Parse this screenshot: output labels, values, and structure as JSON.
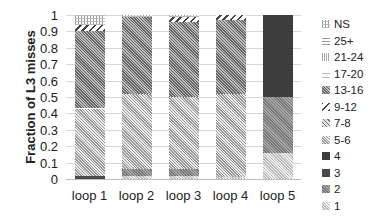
{
  "chart_data": {
    "type": "bar",
    "stacked": true,
    "title": "",
    "xlabel": "",
    "ylabel": "Fraction of L3 misses",
    "ylim": [
      0,
      1
    ],
    "yticks": [
      "0",
      "0.1",
      "0.2",
      "0.3",
      "0.4",
      "0.5",
      "0.6",
      "0.7",
      "0.8",
      "0.9",
      "1"
    ],
    "grid": true,
    "legend_position": "right",
    "categories": [
      "loop 1",
      "loop 2",
      "loop 3",
      "loop 4",
      "loop 5"
    ],
    "series": [
      {
        "name": "1",
        "key": "1",
        "values": [
          0.0,
          0.02,
          0.02,
          0.01,
          0.16
        ]
      },
      {
        "name": "2",
        "key": "2",
        "values": [
          0.0,
          0.04,
          0.04,
          0.0,
          0.34
        ]
      },
      {
        "name": "3",
        "key": "3",
        "values": [
          0.02,
          0.0,
          0.0,
          0.0,
          0.0
        ]
      },
      {
        "name": "4",
        "key": "4",
        "values": [
          0.0,
          0.0,
          0.0,
          0.0,
          0.5
        ]
      },
      {
        "name": "5-6",
        "key": "5",
        "values": [
          0.41,
          0.46,
          0.44,
          0.51,
          0.0
        ]
      },
      {
        "name": "7-8",
        "key": "7",
        "values": [
          0.0,
          0.0,
          0.0,
          0.0,
          0.0
        ]
      },
      {
        "name": "13-16",
        "key": "13",
        "values": [
          0.47,
          0.47,
          0.46,
          0.45,
          0.0
        ]
      },
      {
        "name": "9-12",
        "key": "9",
        "values": [
          0.04,
          0.0,
          0.03,
          0.03,
          0.0
        ]
      },
      {
        "name": "17-20",
        "key": "17",
        "values": [
          0.0,
          0.0,
          0.0,
          0.0,
          0.0
        ]
      },
      {
        "name": "21-24",
        "key": "21",
        "values": [
          0.0,
          0.0,
          0.0,
          0.0,
          0.0
        ]
      },
      {
        "name": "25+",
        "key": "25",
        "values": [
          0.0,
          0.0,
          0.0,
          0.0,
          0.0
        ]
      },
      {
        "name": "NS",
        "key": "NS",
        "values": [
          0.06,
          0.01,
          0.01,
          0.0,
          0.0
        ]
      }
    ],
    "legend": [
      "NS",
      "25+",
      "21-24",
      "17-20",
      "13-16",
      "9-12",
      "7-8",
      "5-6",
      "4",
      "3",
      "2",
      "1"
    ]
  }
}
